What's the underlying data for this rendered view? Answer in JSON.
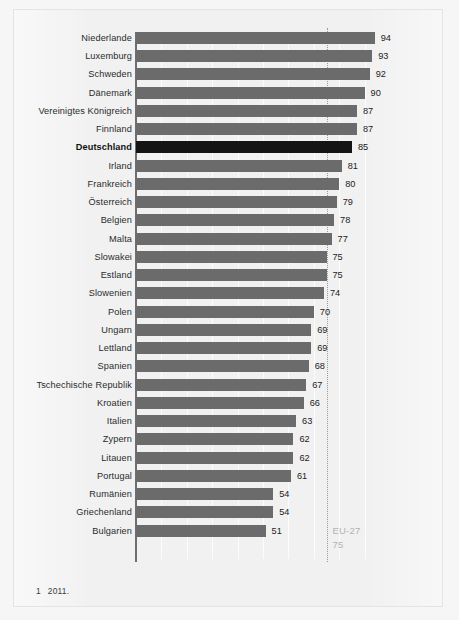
{
  "footnote": {
    "marker": "1",
    "text": "2011."
  },
  "reference": {
    "label": "EU-27",
    "value": "75",
    "value_num": 75
  },
  "chart_data": {
    "type": "bar",
    "orientation": "horizontal",
    "title": "",
    "xlabel": "",
    "ylabel": "",
    "xlim": [
      0,
      99
    ],
    "grid": true,
    "gridline_values": [
      10,
      20,
      30,
      40,
      50,
      60,
      70,
      80,
      90
    ],
    "legend": "none",
    "highlight_category": "Deutschland",
    "reference_line": {
      "name": "EU-27",
      "value": 75,
      "style": "dotted"
    },
    "annotations": [
      {
        "text": "EU-27",
        "value": 75
      },
      {
        "text": "75",
        "value": 75
      }
    ],
    "categories": [
      "Niederlande¹",
      "Luxemburg",
      "Schweden",
      "Dänemark¹",
      "Vereinigtes Königreich",
      "Finnland",
      "Deutschland",
      "Irland",
      "Frankreich",
      "Österreich",
      "Belgien",
      "Malta",
      "Slowakei",
      "Estland",
      "Slowenien",
      "Polen",
      "Ungarn",
      "Lettland",
      "Spanien",
      "Tschechische Republik¹",
      "Kroatien",
      "Italien",
      "Zypern",
      "Litauen",
      "Portugal",
      "Rumänien",
      "Griechenland",
      "Bulgarien"
    ],
    "values": [
      94,
      93,
      92,
      90,
      87,
      87,
      85,
      81,
      80,
      79,
      78,
      77,
      75,
      75,
      74,
      70,
      69,
      69,
      68,
      67,
      66,
      63,
      62,
      62,
      61,
      54,
      54,
      51
    ]
  },
  "rows": [
    {
      "label": "Niederlande",
      "sup": "1",
      "value": 94,
      "highlight": false
    },
    {
      "label": "Luxemburg",
      "sup": "",
      "value": 93,
      "highlight": false
    },
    {
      "label": "Schweden",
      "sup": "",
      "value": 92,
      "highlight": false
    },
    {
      "label": "Dänemark",
      "sup": "1",
      "value": 90,
      "highlight": false
    },
    {
      "label": "Vereinigtes Königreich",
      "sup": "",
      "value": 87,
      "highlight": false
    },
    {
      "label": "Finnland",
      "sup": "",
      "value": 87,
      "highlight": false
    },
    {
      "label": "Deutschland",
      "sup": "",
      "value": 85,
      "highlight": true
    },
    {
      "label": "Irland",
      "sup": "",
      "value": 81,
      "highlight": false
    },
    {
      "label": "Frankreich",
      "sup": "",
      "value": 80,
      "highlight": false
    },
    {
      "label": "Österreich",
      "sup": "",
      "value": 79,
      "highlight": false
    },
    {
      "label": "Belgien",
      "sup": "",
      "value": 78,
      "highlight": false
    },
    {
      "label": "Malta",
      "sup": "",
      "value": 77,
      "highlight": false
    },
    {
      "label": "Slowakei",
      "sup": "",
      "value": 75,
      "highlight": false
    },
    {
      "label": "Estland",
      "sup": "",
      "value": 75,
      "highlight": false
    },
    {
      "label": "Slowenien",
      "sup": "",
      "value": 74,
      "highlight": false
    },
    {
      "label": "Polen",
      "sup": "",
      "value": 70,
      "highlight": false
    },
    {
      "label": "Ungarn",
      "sup": "",
      "value": 69,
      "highlight": false
    },
    {
      "label": "Lettland",
      "sup": "",
      "value": 69,
      "highlight": false
    },
    {
      "label": "Spanien",
      "sup": "",
      "value": 68,
      "highlight": false
    },
    {
      "label": "Tschechische Republik",
      "sup": "1",
      "value": 67,
      "highlight": false
    },
    {
      "label": "Kroatien",
      "sup": "",
      "value": 66,
      "highlight": false
    },
    {
      "label": "Italien",
      "sup": "",
      "value": 63,
      "highlight": false
    },
    {
      "label": "Zypern",
      "sup": "",
      "value": 62,
      "highlight": false
    },
    {
      "label": "Litauen",
      "sup": "",
      "value": 62,
      "highlight": false
    },
    {
      "label": "Portugal",
      "sup": "",
      "value": 61,
      "highlight": false
    },
    {
      "label": "Rumänien",
      "sup": "",
      "value": 54,
      "highlight": false
    },
    {
      "label": "Griechenland",
      "sup": "",
      "value": 54,
      "highlight": false
    },
    {
      "label": "Bulgarien",
      "sup": "",
      "value": 51,
      "highlight": false
    }
  ]
}
